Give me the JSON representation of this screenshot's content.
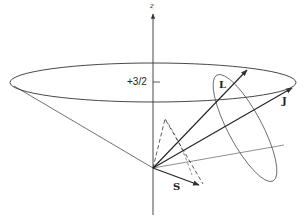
{
  "diagram": {
    "type": "vector-model-angular-momentum-coupling",
    "axis": {
      "label": "z"
    },
    "projection_label": "+3/2",
    "vectors": [
      {
        "id": "L",
        "label": "L"
      },
      {
        "id": "J",
        "label": "J"
      },
      {
        "id": "S",
        "label": "S"
      }
    ],
    "colors": {
      "line": "#333333",
      "text": "#222222",
      "background": "#ffffff"
    }
  }
}
